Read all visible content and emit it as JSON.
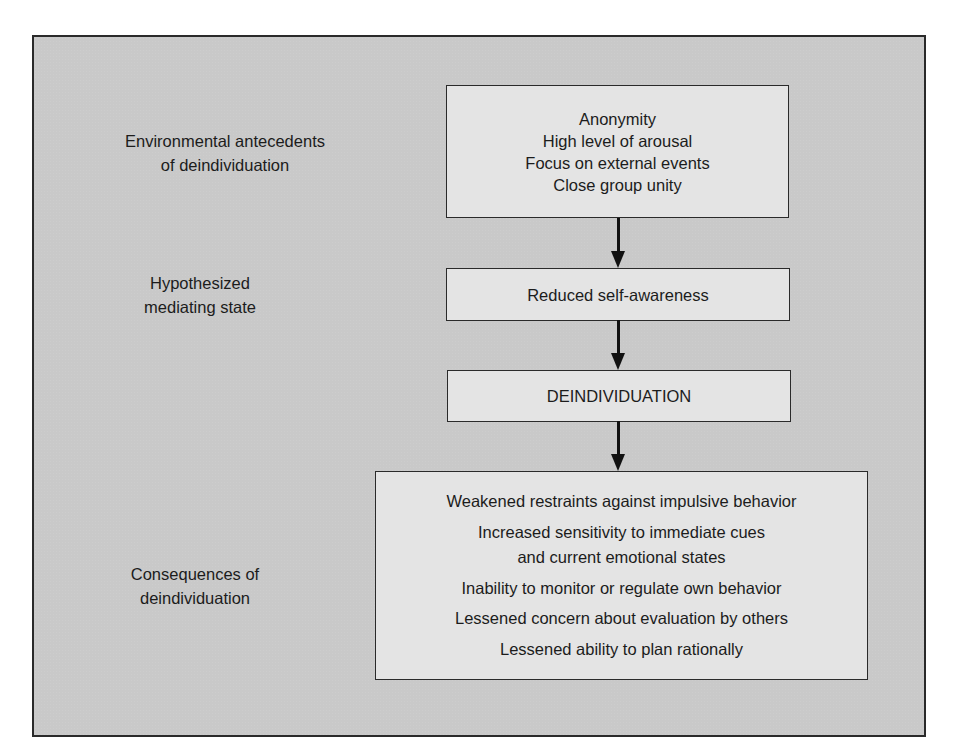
{
  "diagram": {
    "rows": [
      {
        "label": [
          "Environmental antecedents",
          "of deindividuation"
        ],
        "box": [
          "Anonymity",
          "High level of arousal",
          "Focus on external events",
          "Close group unity"
        ]
      },
      {
        "label": [
          "Hypothesized",
          "mediating state"
        ],
        "box": [
          "Reduced self-awareness"
        ]
      },
      {
        "label": [],
        "box": [
          "DEINDIVIDUATION"
        ]
      },
      {
        "label": [
          "Consequences of",
          "deindividuation"
        ],
        "box": [
          "Weakened restraints against impulsive behavior",
          "Increased sensitivity to immediate cues",
          "and current emotional states",
          "Inability to monitor or regulate own behavior",
          "Lessened concern about evaluation by others",
          "Lessened ability to plan rationally"
        ]
      }
    ],
    "colors": {
      "frame_background": "#c9c9c9",
      "box_background": "#e4e4e4",
      "line": "#111111"
    }
  }
}
